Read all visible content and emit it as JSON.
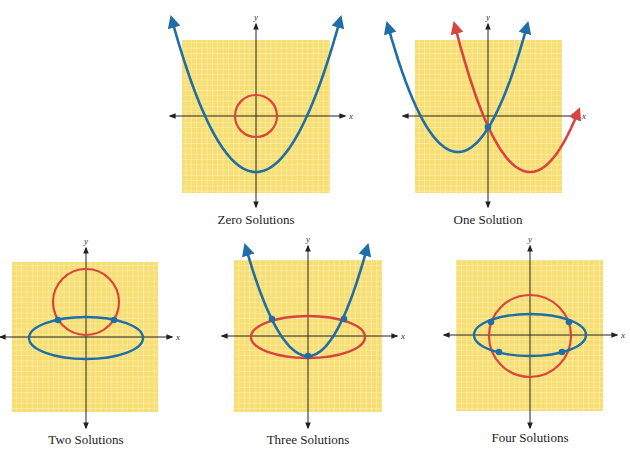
{
  "figure": {
    "colors": {
      "grid_fill": "#F7DE72",
      "grid_line": "#FFF6CF",
      "axis": "#222222",
      "curve_blue": "#1F6EA6",
      "curve_red": "#D8443F",
      "point": "#1F6EA6"
    },
    "axis_labels": {
      "x": "x",
      "y": "y"
    },
    "panels": [
      {
        "id": "zero",
        "caption": "Zero Solutions",
        "grid": {
          "x0": 182,
          "y0": 40,
          "x1": 330,
          "y1": 193
        },
        "origin": {
          "x": 256,
          "y": 116
        },
        "x_axis": {
          "x0": 170,
          "x1": 345
        },
        "y_axis": {
          "y0": 24,
          "y1": 207
        },
        "curves": [
          {
            "type": "parabola",
            "color": "blue",
            "vertex": [
              256,
              172
            ],
            "left_end": [
              172,
              20
            ],
            "right_end": [
              340,
              20
            ]
          },
          {
            "type": "circle",
            "color": "red",
            "center": [
              256,
              116
            ],
            "r": 21
          }
        ],
        "intersections": [],
        "caption_pos": {
          "x": 256,
          "y": 212
        }
      },
      {
        "id": "one",
        "caption": "One Solution",
        "grid": {
          "x0": 415,
          "y0": 40,
          "x1": 562,
          "y1": 193
        },
        "origin": {
          "x": 488,
          "y": 116
        },
        "x_axis": {
          "x0": 403,
          "x1": 578
        },
        "y_axis": {
          "y0": 24,
          "y1": 207
        },
        "curves": [
          {
            "type": "parabola",
            "color": "blue",
            "vertex": [
              458,
              152
            ],
            "left_end": [
              388,
              26
            ],
            "right_end": [
              527,
              26
            ]
          },
          {
            "type": "parabola",
            "color": "red",
            "vertex": [
              530,
              172
            ],
            "left_end": [
              455,
              26
            ],
            "right_end": [
              578,
              112
            ]
          }
        ],
        "intersections": [
          [
            488,
            127
          ]
        ],
        "caption_pos": {
          "x": 488,
          "y": 212
        }
      },
      {
        "id": "two",
        "caption": "Two Solutions",
        "grid": {
          "x0": 12,
          "y0": 262,
          "x1": 158,
          "y1": 412
        },
        "origin": {
          "x": 86,
          "y": 337
        },
        "x_axis": {
          "x0": 0,
          "x1": 172
        },
        "y_axis": {
          "y0": 248,
          "y1": 428
        },
        "curves": [
          {
            "type": "circle",
            "color": "red",
            "center": [
              86,
              302
            ],
            "r": 33
          },
          {
            "type": "ellipse",
            "color": "blue",
            "center": [
              86,
              338
            ],
            "rx": 57,
            "ry": 21
          }
        ],
        "intersections": [
          [
            58,
            320
          ],
          [
            114,
            320
          ]
        ],
        "caption_pos": {
          "x": 86,
          "y": 432
        }
      },
      {
        "id": "three",
        "caption": "Three Solutions",
        "grid": {
          "x0": 234,
          "y0": 260,
          "x1": 382,
          "y1": 412
        },
        "origin": {
          "x": 308,
          "y": 336
        },
        "x_axis": {
          "x0": 222,
          "x1": 397
        },
        "y_axis": {
          "y0": 246,
          "y1": 428
        },
        "curves": [
          {
            "type": "ellipse",
            "color": "red",
            "center": [
              308,
              337
            ],
            "rx": 57,
            "ry": 21
          },
          {
            "type": "parabola",
            "color": "blue",
            "vertex": [
              308,
              356
            ],
            "left_end": [
              246,
              248
            ],
            "right_end": [
              367,
              248
            ]
          }
        ],
        "intersections": [
          [
            272,
            319
          ],
          [
            344,
            319
          ],
          [
            308,
            356
          ]
        ],
        "caption_pos": {
          "x": 308,
          "y": 432
        }
      },
      {
        "id": "four",
        "caption": "Four Solutions",
        "grid": {
          "x0": 456,
          "y0": 260,
          "x1": 603,
          "y1": 411
        },
        "origin": {
          "x": 530,
          "y": 335
        },
        "x_axis": {
          "x0": 444,
          "x1": 617
        },
        "y_axis": {
          "y0": 246,
          "y1": 428
        },
        "curves": [
          {
            "type": "circle",
            "color": "red",
            "center": [
              530,
              336
            ],
            "r": 41
          },
          {
            "type": "ellipse",
            "color": "blue",
            "center": [
              530,
              335
            ],
            "rx": 56,
            "ry": 21
          }
        ],
        "intersections": [
          [
            491,
            322
          ],
          [
            569,
            322
          ],
          [
            499,
            352
          ],
          [
            562,
            352
          ]
        ],
        "caption_pos": {
          "x": 530,
          "y": 430
        }
      }
    ]
  }
}
